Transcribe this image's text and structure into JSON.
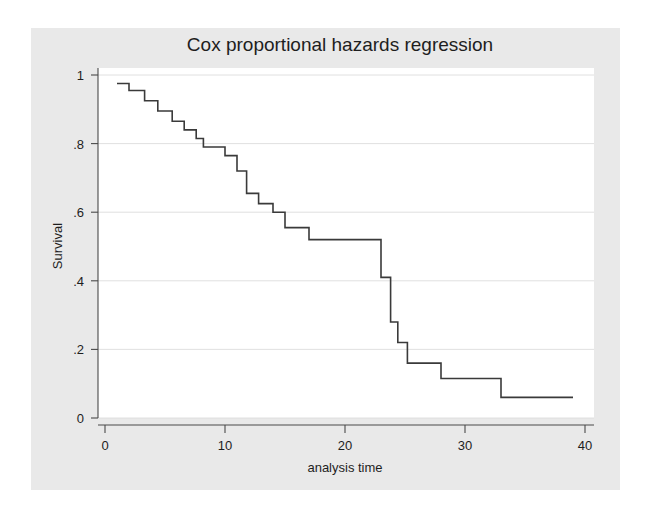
{
  "figure": {
    "background": "#e9e9e9",
    "plot_background": "#ffffff",
    "page_background": "#ffffff"
  },
  "chart_data": {
    "type": "line",
    "subtype": "step-post",
    "title": "Cox proportional hazards regression",
    "xlabel": "analysis time",
    "ylabel": "Survival",
    "xlim": [
      0,
      40
    ],
    "ylim": [
      0,
      1
    ],
    "xticks": [
      0,
      10,
      20,
      30,
      40
    ],
    "xticklabels": [
      "0",
      "10",
      "20",
      "30",
      "40"
    ],
    "yticks": [
      0,
      0.2,
      0.4,
      0.6,
      0.8,
      1
    ],
    "yticklabels": [
      "0",
      ".2",
      ".4",
      ".6",
      ".8",
      "1"
    ],
    "grid": "horizontal",
    "grid_color": "#dcdcdc",
    "legend": null,
    "line_color": "#3a3a3a",
    "series": [
      {
        "name": "Survival",
        "x": [
          1.0,
          2.0,
          2.0,
          3.3,
          3.3,
          4.4,
          4.4,
          5.6,
          5.6,
          6.6,
          6.6,
          7.6,
          7.6,
          8.2,
          8.2,
          10.0,
          10.0,
          11.0,
          11.0,
          11.8,
          11.8,
          12.8,
          12.8,
          14.0,
          14.0,
          15.0,
          15.0,
          16.0,
          16.0,
          17.0,
          17.0,
          22.0,
          22.0,
          23.0,
          23.0,
          23.8,
          23.8,
          24.4,
          24.4,
          25.2,
          25.2,
          28.0,
          28.0,
          33.0,
          33.0,
          39.0
        ],
        "y": [
          0.975,
          0.975,
          0.955,
          0.955,
          0.925,
          0.925,
          0.895,
          0.895,
          0.865,
          0.865,
          0.84,
          0.84,
          0.815,
          0.815,
          0.79,
          0.79,
          0.765,
          0.765,
          0.72,
          0.72,
          0.655,
          0.655,
          0.625,
          0.625,
          0.6,
          0.6,
          0.555,
          0.555,
          0.555,
          0.555,
          0.52,
          0.52,
          0.52,
          0.52,
          0.41,
          0.41,
          0.28,
          0.28,
          0.22,
          0.22,
          0.16,
          0.16,
          0.115,
          0.115,
          0.06,
          0.06
        ]
      }
    ]
  }
}
